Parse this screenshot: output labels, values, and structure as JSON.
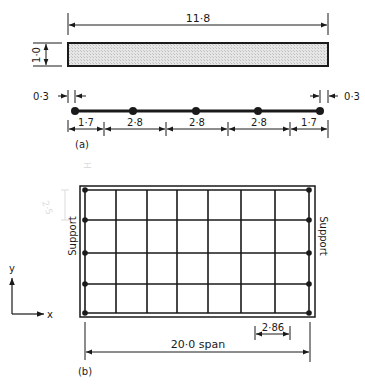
{
  "part_a": {
    "caption": "(a)",
    "overall_length_label": "11·8",
    "depth_label": "1·0",
    "end_offset_left_label": "0·3",
    "end_offset_right_label": "0·3",
    "segments": [
      {
        "label": "1·7"
      },
      {
        "label": "2·8"
      },
      {
        "label": "2·8"
      },
      {
        "label": "2·8"
      },
      {
        "label": "1·7"
      }
    ],
    "node_count": 5
  },
  "part_b": {
    "caption": "(b)",
    "support_left_label": "Support",
    "support_right_label": "Support",
    "span_label": "20·0 span",
    "grid_spacing_label": "2·86",
    "axis_x_label": "x",
    "axis_y_label": "y",
    "grid_columns": 7,
    "grid_rows": 4,
    "pencil_note_1": "2·5",
    "pencil_note_2": "H"
  },
  "colors": {
    "ink": "#1a1a1a",
    "hatch": "#d8d8d8",
    "pencil": "#c8c8c8"
  }
}
